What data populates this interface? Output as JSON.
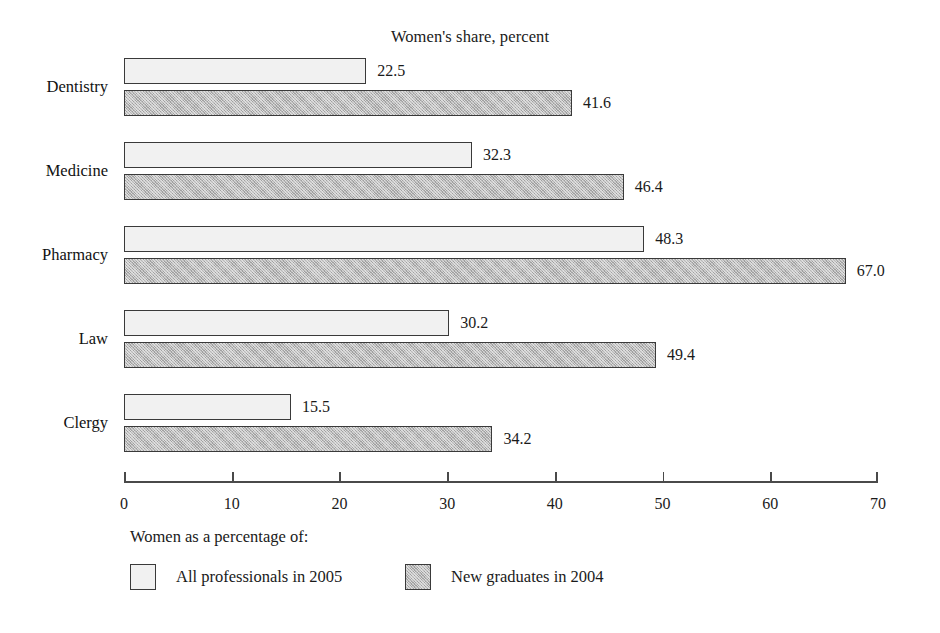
{
  "chart_data": {
    "type": "bar",
    "orientation": "horizontal",
    "title": "Women's share, percent",
    "xlabel": "",
    "ylabel": "",
    "xlim": [
      0,
      70
    ],
    "xticks": [
      0,
      10,
      20,
      30,
      40,
      50,
      60,
      70
    ],
    "xtick_labels": [
      "0",
      "10",
      "20",
      "30",
      "40",
      "50",
      "60",
      "70"
    ],
    "grid": false,
    "legend_position": "bottom-left",
    "legend_caption": "Women as a percentage of:",
    "categories": [
      "Dentistry",
      "Medicine",
      "Pharmacy",
      "Law",
      "Clergy"
    ],
    "series": [
      {
        "name": "All professionals in 2005",
        "swatch": "light",
        "color": "#f1f1f1",
        "values": [
          22.5,
          32.3,
          48.3,
          30.2,
          15.5
        ],
        "value_labels": [
          "22.5",
          "32.3",
          "48.3",
          "30.2",
          "15.5"
        ]
      },
      {
        "name": "New graduates in 2004",
        "swatch": "hatched-gray",
        "color": "#b9b9b9",
        "values": [
          41.6,
          46.4,
          67.0,
          49.4,
          34.2
        ],
        "value_labels": [
          "41.6",
          "46.4",
          "67.0",
          "49.4",
          "34.2"
        ]
      }
    ]
  },
  "colors": {
    "background": "#ffffff",
    "axis": "#4a4a4a",
    "bar_border": "#3a3a3a",
    "series_light": "#f1f1f1",
    "series_dark": "#b9b9b9",
    "text": "#1a1a1a"
  }
}
